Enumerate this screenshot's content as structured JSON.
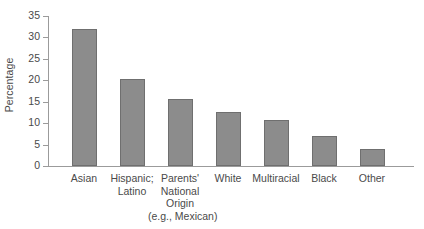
{
  "chart_data": {
    "type": "bar",
    "title": "",
    "xlabel": "",
    "ylabel": "Percentage",
    "ylim": [
      0,
      35
    ],
    "yticks": [
      0,
      5,
      10,
      15,
      20,
      25,
      30,
      35
    ],
    "ytick_labels": [
      "0",
      "5",
      "10",
      "15",
      "20",
      "25",
      "30",
      "35"
    ],
    "grid": false,
    "legend": false,
    "categories": [
      "Asian",
      "Hispanic; Latino",
      "Parents' National Origin (e.g., Mexican)",
      "White",
      "Multiracial",
      "Black",
      "Other"
    ],
    "category_label_lines": [
      [
        "Asian"
      ],
      [
        "Hispanic;",
        "Latino"
      ],
      [
        "Parents'",
        "National",
        "Origin",
        "(e.g., Mexican)"
      ],
      [
        "White"
      ],
      [
        "Multiracial"
      ],
      [
        "Black"
      ],
      [
        "Other"
      ]
    ],
    "values": [
      32.0,
      20.4,
      15.7,
      12.5,
      10.7,
      7.0,
      3.9
    ]
  },
  "style": {
    "bar_fill": "#8c8c8c",
    "bar_stroke": "#6f6f6f",
    "axis_color": "#9b9b9b",
    "text_color": "#4a4a4a",
    "background": "#ffffff"
  }
}
